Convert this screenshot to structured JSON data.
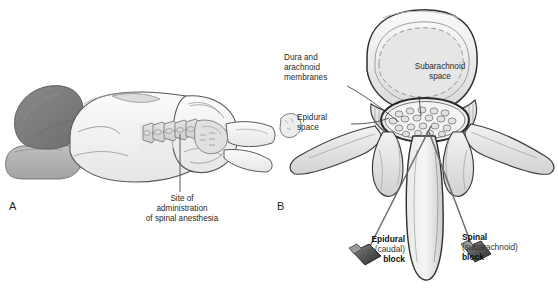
{
  "figure": {
    "background": "#ffffff",
    "ink": "#231f20"
  },
  "panels": [
    {
      "id": "A",
      "label": "A",
      "description": "Patient in lateral decubitus position showing lumbar spine"
    },
    {
      "id": "B",
      "label": "B",
      "description": "Cross-section of lumbar vertebra showing needle placement"
    }
  ],
  "panel_a": {
    "label": "A",
    "callout": {
      "text": "Site of\nadministration\nof spinal anesthesia",
      "lines": [
        "Site of",
        "administration",
        "of spinal anesthesia"
      ]
    },
    "anatomy": [
      "hair",
      "pillow",
      "torso",
      "vertebral-column",
      "pelvis",
      "thigh",
      "leg"
    ],
    "colors": {
      "hair": "#7c7c7c",
      "pillow": "#b3b3b3",
      "skin": "#f2f2f2",
      "bone": "#d9d9d9",
      "outline": "#4a4a4a"
    }
  },
  "panel_b": {
    "label": "B",
    "callouts": [
      {
        "name": "dura-arachnoid",
        "text": "Dura and\narachnoid\nmembranes",
        "align": "left"
      },
      {
        "name": "subarachnoid-space",
        "text": "Subarachnoid\nspace",
        "align": "center"
      },
      {
        "name": "epidural-space",
        "text": "Epidural\nspace",
        "align": "left"
      }
    ],
    "needles": [
      {
        "name": "epidural-block",
        "bold_top": "Epidural",
        "plain": "(caudal)",
        "bold_bottom": "block",
        "align": "right"
      },
      {
        "name": "spinal-block",
        "bold_top": "Spinal",
        "plain": "(subarachnoid)",
        "bold_bottom": "block",
        "align": "left"
      }
    ],
    "anatomy": [
      "vertebral-body",
      "pedicle",
      "transverse-process",
      "lamina",
      "articular-process",
      "spinous-process",
      "dural-sac",
      "cauda-equina"
    ],
    "nerve_root_count": 22,
    "colors": {
      "bone_fill": "#e8e8e8",
      "bone_shade": "#cfcfcf",
      "canal_fill": "#ededed",
      "outline": "#3f3f3f",
      "needle_hub": "#4a4a4a"
    }
  }
}
